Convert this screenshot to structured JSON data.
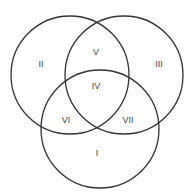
{
  "diagram": {
    "type": "venn",
    "sets": 3,
    "stroke_color": "#333333",
    "label_color": "#444444",
    "circles": [
      {
        "name": "top-left",
        "cx": 70,
        "cy": 75,
        "r": 59
      },
      {
        "name": "top-right",
        "cx": 124,
        "cy": 75,
        "r": 59
      },
      {
        "name": "bottom",
        "cx": 100,
        "cy": 129,
        "r": 59
      }
    ],
    "regions": [
      {
        "id": "I",
        "label": "I",
        "x": 97,
        "y": 154
      },
      {
        "id": "II",
        "label": "II",
        "x": 41,
        "y": 65
      },
      {
        "id": "III",
        "label": "III",
        "x": 159,
        "y": 65
      },
      {
        "id": "IV",
        "label": "IV",
        "x": 96,
        "y": 87
      },
      {
        "id": "V",
        "label": "V",
        "x": 96,
        "y": 53
      },
      {
        "id": "VI",
        "label": "VI",
        "x": 66,
        "y": 121
      },
      {
        "id": "VII",
        "label": "VII",
        "x": 128,
        "y": 121
      }
    ]
  }
}
